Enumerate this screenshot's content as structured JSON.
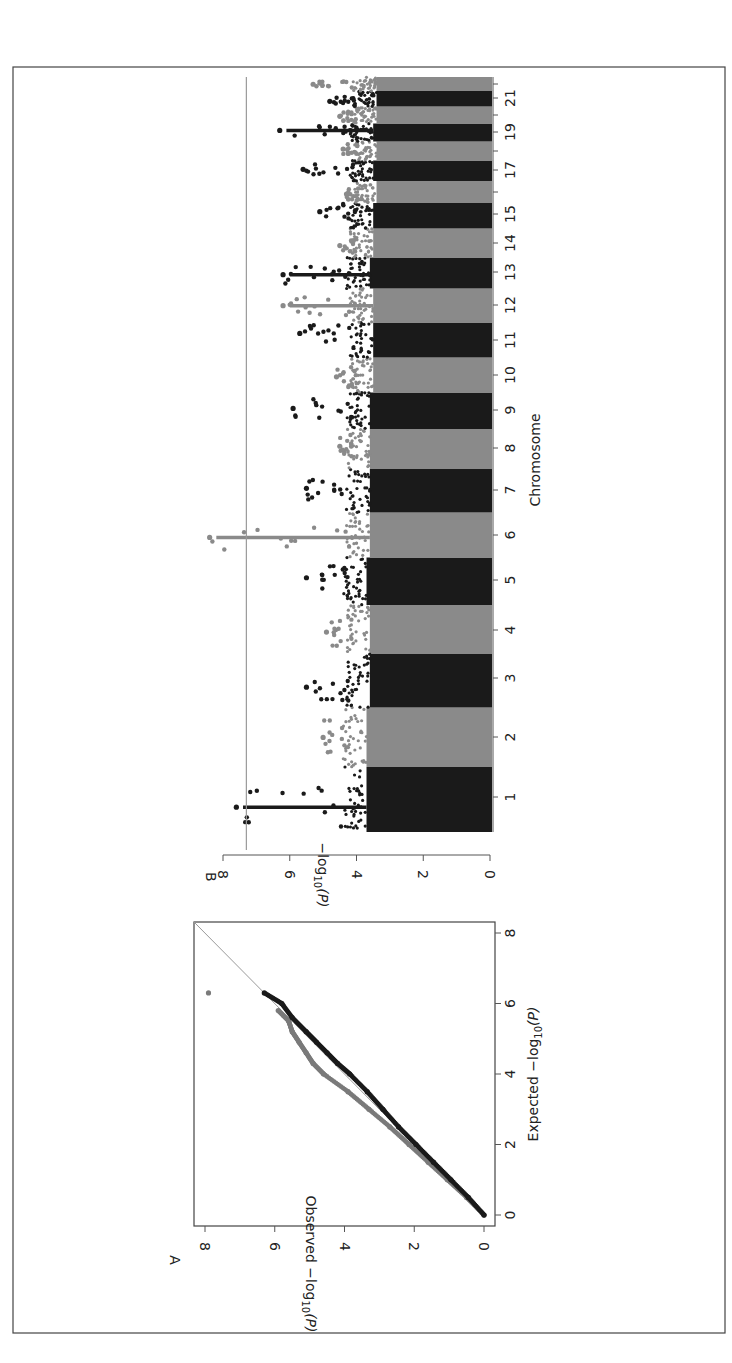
{
  "figure": {
    "orientation": "rotated-90-clockwise",
    "frame_color": "#444444"
  },
  "chart_data": [
    {
      "panel": "A",
      "type": "scatter",
      "title": "",
      "xlabel": "Expected −log10(P)",
      "ylabel": "Observed −log10(P)",
      "xlim": [
        0,
        8
      ],
      "ylim": [
        0,
        8
      ],
      "xticks": [
        0,
        2,
        4,
        6,
        8
      ],
      "yticks": [
        0,
        2,
        4,
        6,
        8
      ],
      "reference_line": {
        "from": [
          0,
          0
        ],
        "to": [
          8,
          8
        ],
        "color": "#999999"
      },
      "series": [
        {
          "name": "cohort-grey",
          "color": "#7a7a7a",
          "x": [
            0.0,
            0.5,
            1.0,
            1.5,
            2.0,
            2.5,
            3.0,
            3.5,
            4.0,
            4.3,
            4.6,
            4.9,
            5.2,
            5.5,
            5.8
          ],
          "y": [
            0.0,
            0.5,
            1.05,
            1.6,
            2.15,
            2.7,
            3.3,
            3.9,
            4.6,
            4.9,
            5.1,
            5.3,
            5.5,
            5.6,
            5.9
          ]
        },
        {
          "name": "cohort-black",
          "color": "#1a1a1a",
          "x": [
            0.0,
            0.5,
            1.0,
            1.5,
            2.0,
            2.5,
            3.0,
            3.5,
            4.0,
            4.3,
            4.6,
            4.9,
            5.2,
            5.6,
            6.0,
            6.3
          ],
          "y": [
            0.0,
            0.45,
            0.95,
            1.45,
            1.95,
            2.45,
            2.9,
            3.35,
            3.85,
            4.2,
            4.5,
            4.8,
            5.1,
            5.5,
            5.8,
            6.3
          ]
        },
        {
          "name": "outlier",
          "color": "#7a7a7a",
          "x": [
            6.3
          ],
          "y": [
            7.9
          ]
        }
      ],
      "labels": {
        "panel_letter": "A",
        "xlabel_main": "Expected −log",
        "xlabel_sub": "10",
        "xlabel_tail": "(P)",
        "ylabel_main": "Observed −log",
        "ylabel_sub": "10",
        "ylabel_tail": "(P)",
        "ticks": [
          "0",
          "2",
          "4",
          "6",
          "8"
        ]
      }
    },
    {
      "panel": "B",
      "type": "scatter",
      "subtype": "manhattan",
      "title": "",
      "xlabel": "Chromosome",
      "ylabel": "−log10(P)",
      "ylim": [
        0,
        8
      ],
      "yticks": [
        0,
        2,
        4,
        6,
        8
      ],
      "significance_threshold": 7.3,
      "threshold_color": "#999999",
      "colors": {
        "odd": "#1a1a1a",
        "even": "#8a8a8a"
      },
      "categories": [
        "1",
        "2",
        "3",
        "4",
        "5",
        "6",
        "7",
        "8",
        "9",
        "10",
        "11",
        "12",
        "13",
        "14",
        "15",
        "16",
        "17",
        "18",
        "19",
        "20",
        "21",
        "22"
      ],
      "tick_labels": [
        "1",
        "2",
        "3",
        "4",
        "5",
        "6",
        "7",
        "8",
        "9",
        "10",
        "11",
        "12",
        "13",
        "14",
        "15",
        "17",
        "19",
        "21"
      ],
      "peak_values": [
        7.6,
        5.0,
        5.5,
        4.9,
        5.5,
        8.4,
        5.5,
        4.5,
        5.9,
        4.6,
        5.7,
        6.2,
        6.2,
        4.5,
        5.1,
        4.3,
        5.6,
        4.4,
        6.3,
        4.5,
        4.8,
        5.3
      ],
      "baseline_max": [
        3.7,
        3.7,
        3.6,
        3.6,
        3.7,
        3.6,
        3.6,
        3.6,
        3.6,
        3.5,
        3.5,
        3.5,
        3.6,
        3.5,
        3.5,
        3.4,
        3.5,
        3.4,
        3.5,
        3.4,
        3.4,
        3.4
      ],
      "labels": {
        "panel_letter": "B",
        "xlabel": "Chromosome",
        "ylabel_main": "−log",
        "ylabel_sub": "10",
        "ylabel_tail": "(P)",
        "ticks": [
          "0",
          "2",
          "4",
          "6",
          "8"
        ]
      }
    }
  ]
}
